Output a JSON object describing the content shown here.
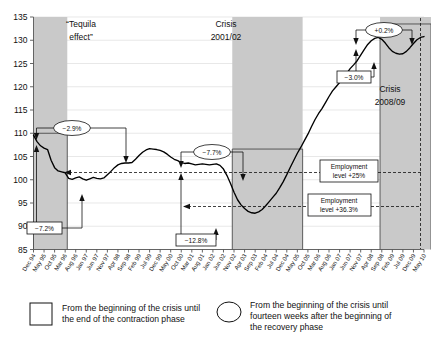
{
  "chart_data": {
    "type": "line",
    "title": "",
    "xlabel": "",
    "ylabel": "",
    "ylim": [
      85,
      135
    ],
    "ytick_step": 5,
    "yticks": [
      "85",
      "90",
      "95",
      "100",
      "105",
      "110",
      "115",
      "120",
      "125",
      "130",
      "135"
    ],
    "grid": true,
    "legend_position": "bottom",
    "x_tick_labels": [
      "Dec 94",
      "May 95",
      "Oct 95",
      "Mar 96",
      "Aug 96",
      "Jan 97",
      "Jun 97",
      "Nov 97",
      "Apr 98",
      "Sep 98",
      "Feb 99",
      "Jul 99",
      "Dec 99",
      "May 00",
      "Oct 00",
      "Mar 01",
      "Aug 01",
      "Jan 02",
      "Jun 02",
      "Nov 02",
      "Apr 03",
      "Sep 03",
      "Feb 04",
      "Jul 04",
      "Dec 04",
      "May 05",
      "Oct 05",
      "Mar 06",
      "Aug 06",
      "Jan 07",
      "Jun 07",
      "Nov 07",
      "Apr 08",
      "Sep 08",
      "Feb 09",
      "Jul 09",
      "Dec 09",
      "May 10"
    ],
    "series": [
      {
        "name": "Employment index",
        "values": [
          109.6,
          108.2,
          107.3,
          106.8,
          106.5,
          104.2,
          102.6,
          101.9,
          101.7,
          101.5,
          100.3,
          100.1,
          100.4,
          100.6,
          100.2,
          99.9,
          100.2,
          100.5,
          100.3,
          100.2,
          100.4,
          101.1,
          101.8,
          102.6,
          103.2,
          103.5,
          103.6,
          103.6,
          103.7,
          104.4,
          105.2,
          105.9,
          106.4,
          106.7,
          106.6,
          106.5,
          106.3,
          106.0,
          105.5,
          104.9,
          104.4,
          104.1,
          103.7,
          103.5,
          103.6,
          103.4,
          103.2,
          103.3,
          103.4,
          103.3,
          103.2,
          103.3,
          103.4,
          103.1,
          102.3,
          100.9,
          99.2,
          97.3,
          95.7,
          94.6,
          93.8,
          93.2,
          92.9,
          92.8,
          93.1,
          93.6,
          94.4,
          95.3,
          96.2,
          97.1,
          98.3,
          99.6,
          101.1,
          102.7,
          104.2,
          105.7,
          107.0,
          108.4,
          109.8,
          111.4,
          112.9,
          114.2,
          115.3,
          116.6,
          117.9,
          119.1,
          120.0,
          120.9,
          121.7,
          122.8,
          123.9,
          124.7,
          125.6,
          126.8,
          128.0,
          129.1,
          129.9,
          130.4,
          130.6,
          130.2,
          129.4,
          128.4,
          127.6,
          127.2,
          127.0,
          127.1,
          127.6,
          128.4,
          129.3,
          130.1,
          130.6,
          130.8
        ]
      }
    ],
    "shaded_bands": [
      {
        "id": "tequila",
        "label_line1": "“Tequila",
        "label_line2": "effect”",
        "start_label": "Dec 94",
        "end_label": "Jun 97"
      },
      {
        "id": "crisis2001",
        "label_line1": "Crisis",
        "label_line2": "2001/02",
        "start_label": "Mar 01",
        "end_label": "Nov 02"
      },
      {
        "id": "crisis2008",
        "label_line1": "Crisis",
        "label_line2": "2008/09",
        "start_label": "Sep 08",
        "end_label": "May 10"
      }
    ],
    "annotations": {
      "ellipses": [
        {
          "id": "tequila-recovery",
          "text": "−2.9%"
        },
        {
          "id": "crisis2001-recovery",
          "text": "−7.7%"
        },
        {
          "id": "crisis2008-recovery",
          "text": "+0.2%"
        }
      ],
      "boxes": [
        {
          "id": "tequila-contraction",
          "text": "−7.2%"
        },
        {
          "id": "crisis2001-contraction",
          "text": "−12.8%"
        },
        {
          "id": "crisis2008-contraction",
          "text": "−3.0%"
        }
      ],
      "level_notes": [
        {
          "id": "level-25",
          "line1": "Employment",
          "line2": "level +25%"
        },
        {
          "id": "level-36",
          "line1": "Employment",
          "line2": "level +36.3%"
        }
      ]
    }
  },
  "legend": {
    "items": [
      {
        "id": "square",
        "marker": "square-marker",
        "lines": [
          "From the beginning of the crisis until",
          "the end of the contraction phase"
        ]
      },
      {
        "id": "circle",
        "marker": "circle-marker",
        "lines": [
          "From the beginning of the crisis until",
          "fourteen weeks after the beginning of",
          "the recovery phase"
        ]
      }
    ]
  },
  "colors": {
    "band": "#c9c9c9",
    "line": "#000000",
    "grid": "#d8d8d8",
    "background": "#ffffff"
  }
}
